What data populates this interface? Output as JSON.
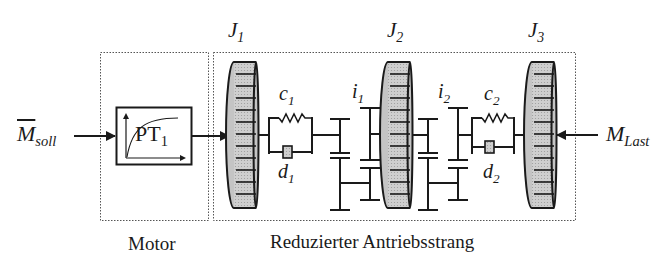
{
  "diagram": {
    "type": "mechanical drivetrain block diagram",
    "groups": [
      {
        "id": "motor",
        "label": "Motor"
      },
      {
        "id": "drivetrain",
        "label": "Reduzierter Antriebsstrang"
      }
    ],
    "input": {
      "symbol": "M",
      "subscript": "soll",
      "overline": true
    },
    "load": {
      "symbol": "M",
      "subscript": "Last"
    },
    "block": {
      "text": "PT",
      "subscript": "1",
      "icon": "step-response-icon"
    },
    "inertias": [
      {
        "symbol": "J",
        "subscript": "1"
      },
      {
        "symbol": "J",
        "subscript": "2"
      },
      {
        "symbol": "J",
        "subscript": "3"
      }
    ],
    "springs": [
      {
        "symbol": "c",
        "subscript": "1"
      },
      {
        "symbol": "c",
        "subscript": "2"
      }
    ],
    "dampers": [
      {
        "symbol": "d",
        "subscript": "1"
      },
      {
        "symbol": "d",
        "subscript": "2"
      }
    ],
    "gears": [
      {
        "symbol": "i",
        "subscript": "1"
      },
      {
        "symbol": "i",
        "subscript": "2"
      }
    ],
    "colors": {
      "line": "#1a1a1a",
      "disc_fill": "#c8c8c8",
      "disc_face": "#b9b9b9",
      "box_border": "#555555"
    }
  }
}
